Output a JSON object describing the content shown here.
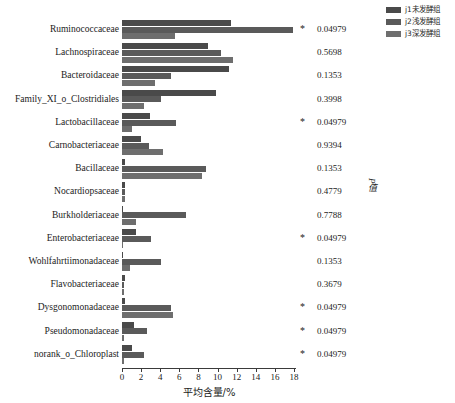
{
  "legend": {
    "items": [
      {
        "label": "j1未发酵组",
        "color": "#4a4a4a"
      },
      {
        "label": "j2浅发酵组",
        "color": "#5a5a5a"
      },
      {
        "label": "j3深发酵组",
        "color": "#6e6e6e"
      }
    ]
  },
  "axis": {
    "x_title": "平均含量/%",
    "x_ticks": [
      "0",
      "2",
      "4",
      "6",
      "8",
      "10",
      "12",
      "14",
      "16",
      "18"
    ],
    "pvalue_axis_title": "P值"
  },
  "significance_marker": "*",
  "chart_data": {
    "type": "bar",
    "orientation": "horizontal",
    "title": "",
    "xlabel": "平均含量/%",
    "ylabel": "",
    "xlim": [
      0,
      18
    ],
    "xticks": [
      0,
      2,
      4,
      6,
      8,
      10,
      12,
      14,
      16,
      18
    ],
    "grid": false,
    "legend_position": "top-right",
    "categories": [
      "Ruminococcaceae",
      "Lachnospiraceae",
      "Bacteroidaceae",
      "Family_XI_o_Clostridiales",
      "Lactobacillaceae",
      "Carnobacteriaceae",
      "Bacillaceae",
      "Nocardiopsaceae",
      "Burkholderiaceae",
      "Enterobacteriaceae",
      "Wohlfahrtiimonadaceae",
      "Flavobacteriaceae",
      "Dysgonomonadaceae",
      "Pseudomonadaceae",
      "norank_o_Chloroplast"
    ],
    "series": [
      {
        "name": "j1未发酵组",
        "color": "#4a4a4a",
        "values": [
          11.4,
          9.0,
          11.2,
          9.8,
          2.9,
          2.0,
          0.3,
          0.3,
          0.1,
          1.5,
          0.1,
          0.3,
          0.3,
          1.3,
          1.0
        ]
      },
      {
        "name": "j2浅发酵组",
        "color": "#5a5a5a",
        "values": [
          17.9,
          10.4,
          5.1,
          4.1,
          5.7,
          2.8,
          8.8,
          0.3,
          6.7,
          3.0,
          4.1,
          0.2,
          5.1,
          2.6,
          2.3
        ]
      },
      {
        "name": "j3深发酵组",
        "color": "#6e6e6e",
        "values": [
          5.5,
          11.6,
          3.4,
          2.3,
          1.0,
          4.3,
          8.4,
          0.3,
          1.5,
          0.1,
          0.8,
          0.2,
          5.3,
          0.2,
          0.2
        ]
      }
    ],
    "pvalues": [
      "0.04979",
      "0.5698",
      "0.1353",
      "0.3998",
      "0.04979",
      "0.9394",
      "0.1353",
      "0.4779",
      "0.7788",
      "0.04979",
      "0.1353",
      "0.3679",
      "0.04979",
      "0.04979",
      "0.04979"
    ],
    "significant": [
      true,
      false,
      false,
      false,
      true,
      false,
      false,
      false,
      false,
      true,
      false,
      false,
      true,
      true,
      true
    ]
  }
}
